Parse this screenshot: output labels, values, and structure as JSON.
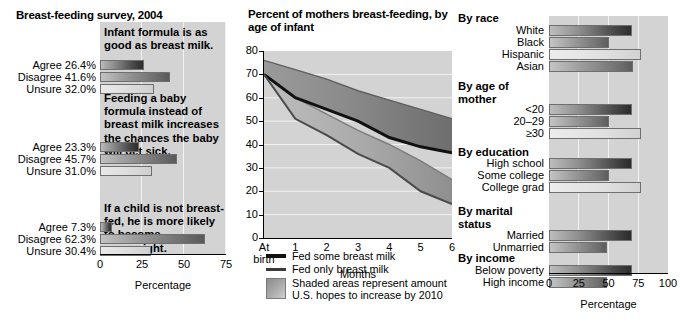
{
  "left": {
    "title": "Breast-feeding survey, 2004",
    "axis_label": "Percentage",
    "ticks": [
      "0",
      "25",
      "50",
      "75"
    ],
    "xlim": [
      0,
      75
    ],
    "groups": [
      {
        "statement": "Infant formula is as good as breast milk.",
        "rows": [
          {
            "label": "Agree 26.4%",
            "value": 26.4,
            "shade": "dark"
          },
          {
            "label": "Disagree 41.6%",
            "value": 41.6,
            "shade": "mid"
          },
          {
            "label": "Unsure 32.0%",
            "value": 32.0,
            "shade": "light"
          }
        ]
      },
      {
        "statement": "Feeding a baby formula instead of breast milk increases the chances the baby will get sick.",
        "rows": [
          {
            "label": "Agree 23.3%",
            "value": 23.3,
            "shade": "dark"
          },
          {
            "label": "Disagree 45.7%",
            "value": 45.7,
            "shade": "mid"
          },
          {
            "label": "Unsure 31.0%",
            "value": 31.0,
            "shade": "light"
          }
        ]
      },
      {
        "statement": "If a child is not breast-fed, he is more likely to become overweight.",
        "rows": [
          {
            "label": "Agree 7.3%",
            "value": 7.3,
            "shade": "dark"
          },
          {
            "label": "Disagree 62.3%",
            "value": 62.3,
            "shade": "mid"
          },
          {
            "label": "Unsure 30.4%",
            "value": 30.4,
            "shade": "light"
          }
        ]
      }
    ]
  },
  "center": {
    "title": "Percent of mothers breast-feeding, by age of infant",
    "xlabel": "Months",
    "xticks": [
      "At birth",
      "1",
      "2",
      "3",
      "4",
      "5",
      "6"
    ],
    "yticks": [
      "0",
      "10",
      "20",
      "30",
      "40",
      "50",
      "60",
      "70",
      "80"
    ],
    "legend": [
      {
        "swatch": "line-thick",
        "text": "Fed some breast milk"
      },
      {
        "swatch": "line-thin",
        "text": "Fed only breast milk"
      },
      {
        "swatch": "shaded-box",
        "text": "Shaded areas represent amount U.S. hopes to increase by 2010"
      }
    ]
  },
  "right": {
    "axis_label": "Percentage",
    "ticks": [
      "0",
      "25",
      "50",
      "75",
      "100"
    ],
    "xlim": [
      0,
      100
    ],
    "groups": [
      {
        "title": "By race",
        "rows": [
          {
            "label": "White",
            "value": 70,
            "shade": "dark"
          },
          {
            "label": "Black",
            "value": 50,
            "shade": "mid"
          },
          {
            "label": "Hispanic",
            "value": 77,
            "shade": "light"
          },
          {
            "label": "Asian",
            "value": 71,
            "shade": "mid"
          }
        ]
      },
      {
        "title": "By age of mother",
        "rows": [
          {
            "label": "<20",
            "value": 70,
            "shade": "dark"
          },
          {
            "label": "20–29",
            "value": 50,
            "shade": "mid"
          },
          {
            "label": "≥30",
            "value": 77,
            "shade": "light"
          }
        ]
      },
      {
        "title": "By education",
        "rows": [
          {
            "label": "High school",
            "value": 70,
            "shade": "dark"
          },
          {
            "label": "Some college",
            "value": 50,
            "shade": "mid"
          },
          {
            "label": "College grad",
            "value": 77,
            "shade": "light"
          }
        ]
      },
      {
        "title": "By marital status",
        "rows": [
          {
            "label": "Married",
            "value": 70,
            "shade": "dark"
          },
          {
            "label": "Unmarried",
            "value": 49,
            "shade": "mid"
          }
        ]
      },
      {
        "title": "By income",
        "rows": [
          {
            "label": "Below poverty",
            "value": 70,
            "shade": "dark"
          },
          {
            "label": "High income",
            "value": 49,
            "shade": "mid"
          }
        ]
      }
    ]
  },
  "chart_data": [
    {
      "type": "bar",
      "title": "Breast-feeding survey, 2004",
      "orientation": "horizontal",
      "xlabel": "Percentage",
      "ylabel": "",
      "xlim": [
        0,
        75
      ],
      "grid": true,
      "categories": [
        "Infant formula is as good as breast milk. - Agree",
        "Infant formula is as good as breast milk. - Disagree",
        "Infant formula is as good as breast milk. - Unsure",
        "Feeding a baby formula instead of breast milk increases the chances the baby will get sick. - Agree",
        "Feeding a baby formula instead of breast milk increases the chances the baby will get sick. - Disagree",
        "Feeding a baby formula instead of breast milk increases the chances the baby will get sick. - Unsure",
        "If a child is not breast-fed, he is more likely to become overweight. - Agree",
        "If a child is not breast-fed, he is more likely to become overweight. - Disagree",
        "If a child is not breast-fed, he is more likely to become overweight. - Unsure"
      ],
      "values": [
        26.4,
        41.6,
        32.0,
        23.3,
        45.7,
        31.0,
        7.3,
        62.3,
        30.4
      ]
    },
    {
      "type": "line",
      "title": "Percent of mothers breast-feeding, by age of infant",
      "xlabel": "Months",
      "ylabel": "",
      "x": [
        "At birth",
        "1",
        "2",
        "3",
        "4",
        "5",
        "6"
      ],
      "ylim": [
        0,
        80
      ],
      "xlim": [
        0,
        6
      ],
      "grid": true,
      "legend_position": "below-plot",
      "series": [
        {
          "name": "Fed some breast milk",
          "values": [
            70,
            60,
            55,
            50,
            43,
            39,
            36.5
          ]
        },
        {
          "name": "Fed only breast milk",
          "values": [
            70,
            51,
            44,
            36,
            30,
            20,
            14.5
          ]
        },
        {
          "name": "Fed some breast milk — 2010 goal (band top)",
          "values": [
            76,
            72,
            68,
            63,
            59,
            55,
            51
          ]
        },
        {
          "name": "Fed only breast milk — 2010 goal (band top)",
          "values": [
            70,
            60,
            53,
            46,
            40,
            33,
            25
          ]
        }
      ],
      "annotations": [
        "Shaded areas represent amount U.S. hopes to increase by 2010"
      ]
    },
    {
      "type": "bar",
      "title": "",
      "orientation": "horizontal",
      "xlabel": "Percentage",
      "ylabel": "",
      "xlim": [
        0,
        100
      ],
      "grid": true,
      "categories": [
        "White",
        "Black",
        "Hispanic",
        "Asian",
        "<20",
        "20–29",
        "≥30",
        "High school",
        "Some college",
        "College grad",
        "Married",
        "Unmarried",
        "Below poverty",
        "High income"
      ],
      "values": [
        70,
        50,
        77,
        71,
        70,
        50,
        77,
        70,
        50,
        77,
        70,
        49,
        70,
        49
      ],
      "group_titles": [
        "By race",
        "By age of mother",
        "By education",
        "By marital status",
        "By income"
      ]
    }
  ]
}
